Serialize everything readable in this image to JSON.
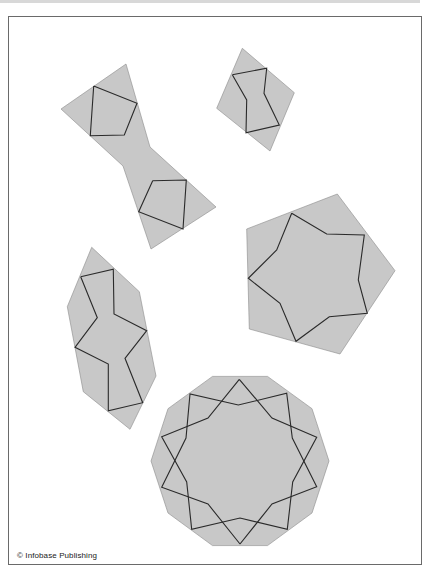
{
  "figure": {
    "credit": "© Infobase Publishing",
    "fill_color": "#c8c8c8",
    "line_color": "#2a2a2a",
    "tiles": [
      {
        "name": "bowtie-tile",
        "outline": "126,64 61,109 123,166 151,249 216,207 150,147",
        "patterns": [
          "93.7,86 137,103.3 124.3,135 90.3,135.7 93.7,86",
          "152.7,180.7 186.3,180 183,229 138.7,211.7 152.7,180.7"
        ]
      },
      {
        "name": "rhombus-tile",
        "outline": "242.3,48.3 294.3,92.7 270,151 216.7,108.3",
        "patterns": [
          "232.3,74.7 266.7,68.3 264,93.3 279.3,125 246,132.7 246.7,100 232.3,74.7"
        ]
      },
      {
        "name": "pentagon-tile",
        "outline": "337.3,194 395,270.7 340,354 249.3,329 246.7,229",
        "patterns": [
          "291.7,213.3 326.7,234 364.3,235 358.3,280 367.3,313.3 329.3,316.7 296,341.3 280,303.3 248.3,278.3 276.7,250 291.7,213.3"
        ]
      },
      {
        "name": "hexagon-tile",
        "outline": "91.7,247.3 139.3,291.7 156,376 130,429.3 83.3,391.7 67.3,306.7",
        "patterns": [
          "80.7,276.7 113.3,269.3 114,314 146.7,330.7 125,358.3 142.7,402.7 108.3,410.7 108.3,364 75,347.3 97.3,317.7 80.7,276.7"
        ]
      },
      {
        "name": "decagon-tile",
        "outline": "212.5,376.4 267.5,376.4 312,408.7 329,461 312,513 267.5,545.6 212.5,545.6 168,513 151,461 168,408.7",
        "patterns": [
          "239.3,379.3 208,418 161.7,436.7 186.7,482 191.7,529.3 240,518 287.3,529.3 292.7,482 316.7,437.3 272,418 239.3,379.3",
          "240,544 208,504 161.7,487.3 186,438 190,394 238.3,405 286.7,393.3 292.3,438 316.7,486.7 272,504 240,544"
        ]
      }
    ]
  }
}
